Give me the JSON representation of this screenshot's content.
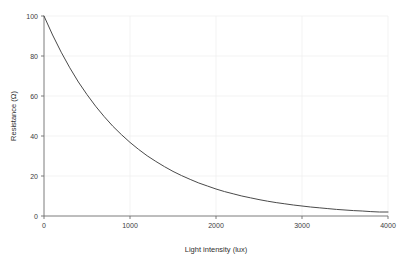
{
  "chart_data": {
    "type": "line",
    "title": "",
    "xlabel": "Light intensity (lux)",
    "ylabel": "Resistance (Ω)",
    "xlim": [
      0,
      4000
    ],
    "ylim": [
      0,
      100
    ],
    "xticks": [
      0,
      1000,
      2000,
      3000,
      4000
    ],
    "xtick_labels": [
      "0",
      "1000",
      "2000",
      "3000",
      "4000"
    ],
    "yticks": [
      0,
      20,
      40,
      60,
      80,
      100
    ],
    "ytick_labels": [
      "0",
      "20",
      "40",
      "60",
      "80",
      "100"
    ],
    "grid": true,
    "legend": null,
    "series": [
      {
        "name": "Resistance vs light intensity",
        "color": "#4a4a4a",
        "x": [
          0,
          100,
          200,
          300,
          400,
          500,
          600,
          700,
          800,
          900,
          1000,
          1100,
          1200,
          1300,
          1400,
          1500,
          1600,
          1700,
          1800,
          1900,
          2000,
          2100,
          2200,
          2300,
          2400,
          2500,
          2600,
          2700,
          2800,
          2900,
          3000,
          3100,
          3200,
          3300,
          3400,
          3500,
          3600,
          3700,
          3800,
          3900,
          4000
        ],
        "values": [
          100.0,
          90.5,
          81.9,
          74.1,
          67.0,
          60.7,
          54.9,
          49.7,
          44.9,
          40.7,
          36.8,
          33.3,
          30.1,
          27.3,
          24.7,
          22.3,
          20.2,
          18.3,
          16.5,
          15.0,
          13.5,
          12.2,
          11.1,
          10.0,
          9.1,
          8.2,
          7.4,
          6.7,
          6.1,
          5.5,
          5.0,
          4.5,
          4.1,
          3.7,
          3.3,
          3.0,
          2.7,
          2.5,
          2.2,
          2.0,
          2.0
        ]
      }
    ]
  },
  "axes": {
    "ylabel_text": "Resistance (Ω)",
    "xlabel_text": "Light intensity (lux)"
  }
}
